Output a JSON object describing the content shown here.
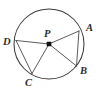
{
  "figure": {
    "kind": "geometry-diagram",
    "background_color": "#ffffff",
    "stroke_color": "#3f3f3f",
    "label_color": "#2b2b2b",
    "center_dot_color": "#111111",
    "width": 100,
    "height": 89
  },
  "circle": {
    "center_label": "P",
    "center_x": 49,
    "center_y": 44,
    "radius": 35
  },
  "points": [
    {
      "label": "A",
      "x": 79,
      "y": 31,
      "label_x": 86,
      "label_y": 31
    },
    {
      "label": "B",
      "x": 76.5,
      "y": 66,
      "label_x": 80,
      "label_y": 74
    },
    {
      "label": "C",
      "x": 32,
      "y": 73.5,
      "label_x": 25,
      "label_y": 86
    },
    {
      "label": "D",
      "x": 16,
      "y": 40.5,
      "label_x": 3,
      "label_y": 45
    },
    {
      "label": "P",
      "x": 49,
      "y": 44,
      "label_x": 44,
      "label_y": 37
    }
  ],
  "segments": [
    {
      "name": "radius-PA",
      "from": "P",
      "to": "A",
      "type": "radius"
    },
    {
      "name": "radius-PB",
      "from": "P",
      "to": "B",
      "type": "radius"
    },
    {
      "name": "radius-PC",
      "from": "P",
      "to": "C",
      "type": "radius"
    },
    {
      "name": "radius-PD",
      "from": "P",
      "to": "D",
      "type": "radius"
    },
    {
      "name": "chord-AB",
      "from": "A",
      "to": "B",
      "type": "chord"
    },
    {
      "name": "chord-DC",
      "from": "D",
      "to": "C",
      "type": "chord"
    }
  ]
}
